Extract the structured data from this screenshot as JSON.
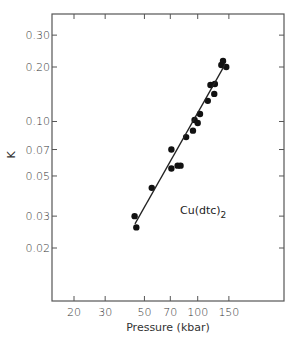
{
  "chart_data": {
    "type": "scatter",
    "title": "",
    "annotation": "Cu(dtc)2",
    "annotation_main": "Cu(dtc)",
    "annotation_sub": "2",
    "xlabel": "Pressure (kbar)",
    "ylabel": "K",
    "xscale": "log",
    "yscale": "log",
    "xlim": [
      14,
      290
    ],
    "ylim": [
      0.0117,
      0.37
    ],
    "grid": false,
    "legend": null,
    "x_ticks": [
      20,
      30,
      50,
      70,
      100,
      150
    ],
    "x_tick_labels": [
      "20",
      "30",
      "50",
      "70",
      "100",
      "150"
    ],
    "y_ticks": [
      0.02,
      0.03,
      0.05,
      0.07,
      0.1,
      0.2,
      0.3
    ],
    "y_tick_labels": [
      "0.02",
      "0.03",
      "0.05",
      "0.07",
      "0.10",
      "0.20",
      "0.30"
    ],
    "series": [
      {
        "name": "Cu(dtc)2 data",
        "kind": "scatter",
        "x": [
          44,
          45,
          55,
          71,
          77,
          80,
          71,
          86,
          94,
          96,
          100,
          103,
          114,
          124,
          118,
          125,
          136,
          139,
          145
        ],
        "y": [
          0.03,
          0.026,
          0.043,
          0.055,
          0.057,
          0.057,
          0.07,
          0.082,
          0.089,
          0.102,
          0.098,
          0.11,
          0.13,
          0.142,
          0.159,
          0.161,
          0.205,
          0.216,
          0.2
        ]
      },
      {
        "name": "fit",
        "kind": "line",
        "x": [
          44.2,
          142
        ],
        "y": [
          0.0272,
          0.205
        ]
      }
    ]
  }
}
